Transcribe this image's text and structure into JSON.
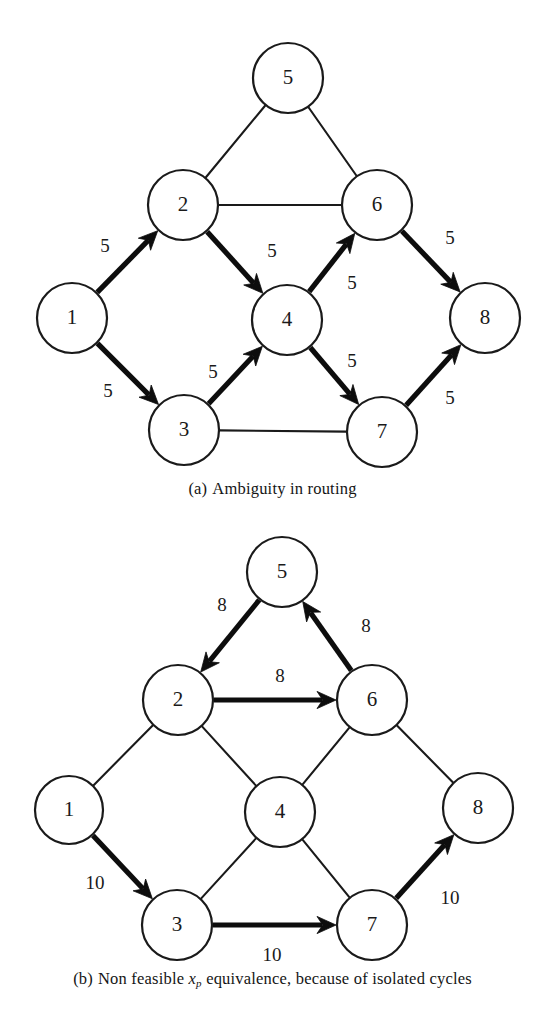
{
  "figure": {
    "ink_color": "#1a1a1a",
    "background_color": "#ffffff"
  },
  "panels": [
    {
      "id": "a",
      "caption_tag": "(a)",
      "caption_text": "Ambiguity in routing",
      "nodes": [
        {
          "label": "5",
          "cx": 288,
          "cy": 78,
          "r": 35
        },
        {
          "label": "2",
          "cx": 183,
          "cy": 205,
          "r": 35
        },
        {
          "label": "6",
          "cx": 377,
          "cy": 205,
          "r": 35
        },
        {
          "label": "1",
          "cx": 72,
          "cy": 318,
          "r": 35
        },
        {
          "label": "4",
          "cx": 287,
          "cy": 320,
          "r": 35
        },
        {
          "label": "8",
          "cx": 485,
          "cy": 318,
          "r": 35
        },
        {
          "label": "3",
          "cx": 184,
          "cy": 430,
          "r": 35
        },
        {
          "label": "7",
          "cx": 382,
          "cy": 432,
          "r": 35
        }
      ],
      "edges": [
        {
          "from": "5",
          "to": "2",
          "style": "plain",
          "directed": false,
          "weight": null
        },
        {
          "from": "5",
          "to": "6",
          "style": "plain",
          "directed": false,
          "weight": null
        },
        {
          "from": "2",
          "to": "6",
          "style": "plain",
          "directed": false,
          "weight": null
        },
        {
          "from": "3",
          "to": "7",
          "style": "plain",
          "directed": false,
          "weight": null
        },
        {
          "from": "1",
          "to": "2",
          "style": "bold",
          "directed": true,
          "weight": "5",
          "wx": 105,
          "wy": 248
        },
        {
          "from": "1",
          "to": "3",
          "style": "bold",
          "directed": true,
          "weight": "5",
          "wx": 108,
          "wy": 393
        },
        {
          "from": "2",
          "to": "4",
          "style": "bold",
          "directed": true,
          "weight": "5",
          "wx": 272,
          "wy": 253
        },
        {
          "from": "3",
          "to": "4",
          "style": "bold",
          "directed": true,
          "weight": "5",
          "wx": 213,
          "wy": 374
        },
        {
          "from": "4",
          "to": "6",
          "style": "bold",
          "directed": true,
          "weight": "5",
          "wx": 352,
          "wy": 285
        },
        {
          "from": "4",
          "to": "7",
          "style": "bold",
          "directed": true,
          "weight": "5",
          "wx": 352,
          "wy": 363
        },
        {
          "from": "6",
          "to": "8",
          "style": "bold",
          "directed": true,
          "weight": "5",
          "wx": 450,
          "wy": 240
        },
        {
          "from": "7",
          "to": "8",
          "style": "bold",
          "directed": true,
          "weight": "5",
          "wx": 450,
          "wy": 400
        }
      ]
    },
    {
      "id": "b",
      "caption_tag": "(b)",
      "caption_prefix": "Non feasible",
      "caption_var": "x",
      "caption_var_sub": "p",
      "caption_suffix": "equivalence, because of isolated cycles",
      "caption_text": "Non feasible x_p equivalence, because of isolated cycles",
      "nodes": [
        {
          "label": "5",
          "cx": 282,
          "cy": 572,
          "r": 35
        },
        {
          "label": "2",
          "cx": 178,
          "cy": 700,
          "r": 35
        },
        {
          "label": "6",
          "cx": 372,
          "cy": 700,
          "r": 35
        },
        {
          "label": "1",
          "cx": 69,
          "cy": 810,
          "r": 34
        },
        {
          "label": "4",
          "cx": 280,
          "cy": 812,
          "r": 35
        },
        {
          "label": "8",
          "cx": 478,
          "cy": 808,
          "r": 35
        },
        {
          "label": "3",
          "cx": 177,
          "cy": 925,
          "r": 35
        },
        {
          "label": "7",
          "cx": 372,
          "cy": 925,
          "r": 35
        }
      ],
      "edges": [
        {
          "from": "5",
          "to": "2",
          "style": "bold",
          "directed": true,
          "weight": "8",
          "wx": 222,
          "wy": 607
        },
        {
          "from": "6",
          "to": "5",
          "style": "bold",
          "directed": true,
          "weight": "8",
          "wx": 366,
          "wy": 628
        },
        {
          "from": "2",
          "to": "6",
          "style": "bold",
          "directed": true,
          "weight": "8",
          "wx": 280,
          "wy": 678
        },
        {
          "from": "1",
          "to": "2",
          "style": "plain",
          "directed": false,
          "weight": null
        },
        {
          "from": "1",
          "to": "3",
          "style": "bold",
          "directed": true,
          "weight": "10",
          "wx": 95,
          "wy": 885
        },
        {
          "from": "2",
          "to": "4",
          "style": "plain",
          "directed": false,
          "weight": null
        },
        {
          "from": "3",
          "to": "4",
          "style": "plain",
          "directed": false,
          "weight": null
        },
        {
          "from": "4",
          "to": "6",
          "style": "plain",
          "directed": false,
          "weight": null
        },
        {
          "from": "4",
          "to": "7",
          "style": "plain",
          "directed": false,
          "weight": null
        },
        {
          "from": "6",
          "to": "8",
          "style": "plain",
          "directed": false,
          "weight": null
        },
        {
          "from": "3",
          "to": "7",
          "style": "bold",
          "directed": true,
          "weight": "10",
          "wx": 272,
          "wy": 957
        },
        {
          "from": "7",
          "to": "8",
          "style": "bold",
          "directed": true,
          "weight": "10",
          "wx": 450,
          "wy": 900
        }
      ]
    }
  ]
}
